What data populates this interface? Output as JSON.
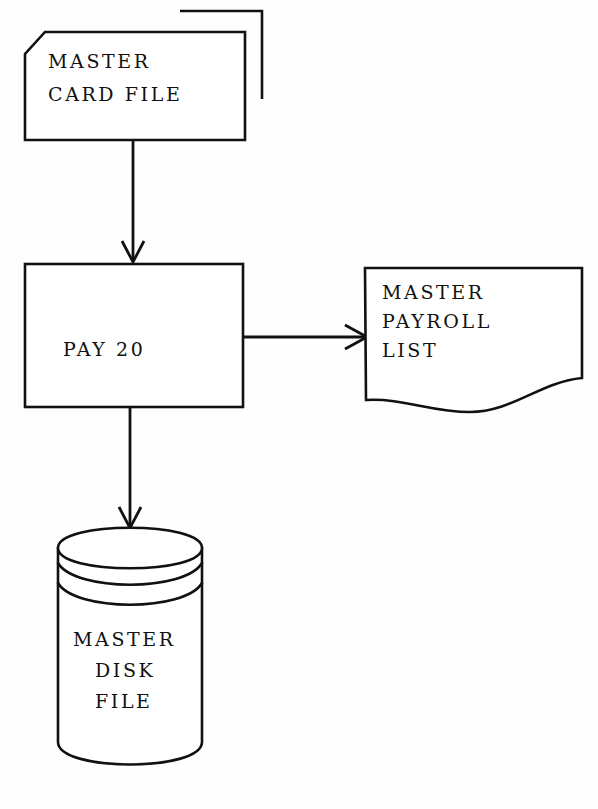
{
  "diagram": {
    "type": "flowchart",
    "background_color": "#fefefe",
    "line_color": "#111111",
    "nodes": [
      {
        "id": "master-card-file",
        "shape": "punched-card-deck",
        "label_lines": [
          "MASTER",
          "CARD FILE"
        ],
        "line1": "MASTER",
        "line2": "CARD FILE"
      },
      {
        "id": "pay-20",
        "shape": "process-rectangle",
        "label_lines": [
          "PAY 20"
        ],
        "line1": "PAY 20"
      },
      {
        "id": "master-payroll-list",
        "shape": "document",
        "label_lines": [
          "MASTER",
          "PAYROLL",
          "LIST"
        ],
        "line1": "MASTER",
        "line2": "PAYROLL",
        "line3": "LIST"
      },
      {
        "id": "master-disk-file",
        "shape": "cylinder-disk-pack",
        "label_lines": [
          "MASTER",
          "DISK",
          "FILE"
        ],
        "line1": "MASTER",
        "line2": "DISK",
        "line3": "FILE"
      }
    ],
    "edges": [
      {
        "id": "card-to-pay",
        "from": "master-card-file",
        "to": "pay-20",
        "direction": "down"
      },
      {
        "id": "pay-to-list",
        "from": "pay-20",
        "to": "master-payroll-list",
        "direction": "right"
      },
      {
        "id": "pay-to-disk",
        "from": "pay-20",
        "to": "master-disk-file",
        "direction": "down"
      }
    ]
  }
}
